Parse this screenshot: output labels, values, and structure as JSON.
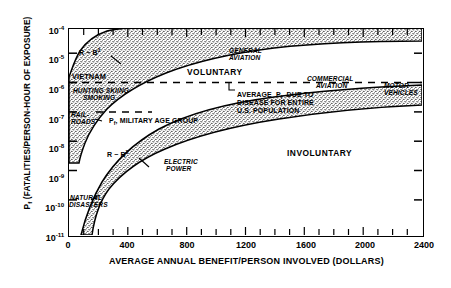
{
  "chart_data": {
    "type": "area",
    "title": "",
    "xlabel": "AVERAGE ANNUAL BENEFIT/PERSON INVOLVED (DOLLARS)",
    "ylabel": "P  (FATALITIES/PERSON-HOUR OF EXPOSURE)",
    "ylabel_subscript": "f",
    "xlim": [
      0,
      2400
    ],
    "xticks": [
      0,
      400,
      800,
      1200,
      1600,
      2000,
      2400
    ],
    "xtick_labels": [
      "0",
      "400",
      "800",
      "1200",
      "1600",
      "2000",
      "2400"
    ],
    "xminor_step": 100,
    "ylim_exponent": [
      -11,
      -4
    ],
    "yticks": [
      -4,
      -5,
      -6,
      -7,
      -8,
      -9,
      -10,
      -11
    ],
    "ytick_labels": [
      "10-4",
      "10-5",
      "10-6",
      "10-7",
      "10-8",
      "10-9",
      "10-10",
      "10-11"
    ],
    "yscale": "log",
    "grid": false,
    "legend": "none",
    "series": [
      {
        "name": "VOLUNTARY",
        "kind": "band",
        "fill": "stipple",
        "upper": [
          [
            60,
            -5.55
          ],
          [
            120,
            -4.95
          ],
          [
            200,
            -4.55
          ],
          [
            320,
            -4.28
          ],
          [
            480,
            -4.14
          ],
          [
            700,
            -4.05
          ],
          [
            1000,
            -4.0
          ],
          [
            1400,
            -3.97
          ],
          [
            2400,
            -3.95
          ]
        ],
        "lower": [
          [
            95,
            -7.6
          ],
          [
            160,
            -6.8
          ],
          [
            260,
            -6.2
          ],
          [
            400,
            -5.62
          ],
          [
            560,
            -5.2
          ],
          [
            760,
            -4.86
          ],
          [
            1000,
            -4.6
          ],
          [
            1300,
            -4.4
          ],
          [
            1700,
            -4.25
          ],
          [
            2100,
            -4.16
          ],
          [
            2400,
            -4.12
          ]
        ]
      },
      {
        "name": "INVOLUNTARY",
        "kind": "band",
        "fill": "stipple",
        "upper": [
          [
            130,
            -10.95
          ],
          [
            200,
            -9.85
          ],
          [
            300,
            -9.15
          ],
          [
            450,
            -8.55
          ],
          [
            650,
            -8.08
          ],
          [
            900,
            -7.7
          ],
          [
            1200,
            -7.4
          ],
          [
            1600,
            -7.12
          ],
          [
            2000,
            -6.95
          ],
          [
            2400,
            -6.82
          ]
        ],
        "lower": [
          [
            200,
            -11.0
          ],
          [
            320,
            -10.25
          ],
          [
            480,
            -9.6
          ],
          [
            700,
            -9.05
          ],
          [
            950,
            -8.65
          ],
          [
            1250,
            -8.32
          ],
          [
            1600,
            -8.05
          ],
          [
            2000,
            -7.85
          ],
          [
            2400,
            -7.7
          ]
        ]
      }
    ],
    "reference_lines": [
      {
        "name": "disease-average",
        "y_exponent": -6,
        "style": "dashed",
        "x_from": 0,
        "x_to": 2400
      },
      {
        "name": "military-age-group",
        "y_exponent": -7,
        "style": "dashed",
        "x_from": 170,
        "x_to": 560
      }
    ],
    "band_labels": [
      {
        "name": "VOLUNTARY",
        "x": 820,
        "y_exponent": -4.55
      },
      {
        "name": "INVOLUNTARY",
        "x": 1520,
        "y_exponent": -7.45
      }
    ],
    "annotations": [
      {
        "name": "r-b3-voluntary",
        "text": "R ~ B",
        "sup": "3",
        "x": 330,
        "y_exponent": -4.93,
        "leader": true
      },
      {
        "name": "r-b3-involuntary",
        "text": "R ~ B",
        "sup": "3",
        "x": 490,
        "y_exponent": -8.38,
        "leader": true
      },
      {
        "name": "vietnam",
        "text": "VIETNAM",
        "x": 50,
        "y_exponent": -5.7
      },
      {
        "name": "hunting-skiing",
        "text": "HUNTING  SKIING",
        "x": 70,
        "y_exponent": -6.22
      },
      {
        "name": "smoking",
        "text": "SMOKING",
        "x": 130,
        "y_exponent": -6.55
      },
      {
        "name": "railroads-line1",
        "text": "RAIL-",
        "x": 40,
        "y_exponent": -7.2
      },
      {
        "name": "railroads-line2",
        "text": "ROADS",
        "x": 40,
        "y_exponent": -7.52
      },
      {
        "name": "military-age-group",
        "text": "P , MILITARY AGE GROUP",
        "sub": "f",
        "x": 300,
        "y_exponent": -7.5
      },
      {
        "name": "general-aviation-line1",
        "text": "GENERAL",
        "x": 1090,
        "y_exponent": -4.35
      },
      {
        "name": "general-aviation-line2",
        "text": "AVIATION",
        "x": 1090,
        "y_exponent": -4.58
      },
      {
        "name": "commercial-aviation-line1",
        "text": "COMMERCIAL",
        "x": 1620,
        "y_exponent": -5.82
      },
      {
        "name": "commercial-aviation-line2",
        "text": "AVIATION",
        "x": 1650,
        "y_exponent": -6.05
      },
      {
        "name": "motor-vehicles-line1",
        "text": "MOTOR",
        "x": 2140,
        "y_exponent": -6.08
      },
      {
        "name": "motor-vehicles-line2",
        "text": "VEHICLES",
        "x": 2140,
        "y_exponent": -6.32
      },
      {
        "name": "disease-note-line1",
        "text": "AVERAGE  P   DUE TO",
        "sub": "f",
        "x": 1140,
        "y_exponent": -6.42
      },
      {
        "name": "disease-note-line2",
        "text": "DISEASE  FOR ENTIRE",
        "x": 1140,
        "y_exponent": -6.68
      },
      {
        "name": "disease-note-line3",
        "text": "U.S. POPULATION",
        "x": 1140,
        "y_exponent": -6.94
      },
      {
        "name": "electric-power-line1",
        "text": "ELECTRIC",
        "x": 640,
        "y_exponent": -8.62
      },
      {
        "name": "electric-power-line2",
        "text": "POWER",
        "x": 650,
        "y_exponent": -8.86
      },
      {
        "name": "natural-disasters-line1",
        "text": "NATURAL",
        "x": 40,
        "y_exponent": -10.05
      },
      {
        "name": "natural-disasters-line2",
        "text": "DISASTERS",
        "x": 35,
        "y_exponent": -10.32
      }
    ]
  }
}
